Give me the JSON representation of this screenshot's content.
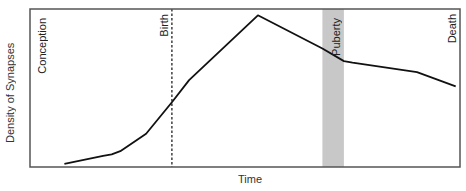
{
  "chart_data": {
    "type": "line",
    "title": "",
    "xlabel": "Time",
    "ylabel": "Density of Synapses",
    "grid": false,
    "legend": null,
    "xlim": [
      0,
      100
    ],
    "ylim": [
      0,
      100
    ],
    "annotations": [
      {
        "label": "Conception",
        "x": 2,
        "style": "text"
      },
      {
        "label": "Birth",
        "x": 33,
        "style": "dashed-vline"
      },
      {
        "label": "Puberty",
        "x_range": [
          68,
          73
        ],
        "style": "shaded-band",
        "color": "#c8c8c8"
      },
      {
        "label": "Death",
        "x": 99,
        "style": "text"
      }
    ],
    "series": [
      {
        "name": "Synaptic density",
        "color": "#111111",
        "x": [
          8,
          17,
          19,
          21,
          27,
          33,
          37,
          53,
          68,
          73,
          75,
          90,
          99
        ],
        "y": [
          2,
          7,
          8,
          10,
          21,
          41,
          55,
          96,
          75,
          67,
          66,
          60,
          51
        ]
      }
    ]
  },
  "labels": {
    "ylabel": "Density of Synapses",
    "xlabel": "Time",
    "conception": "Conception",
    "birth": "Birth",
    "puberty": "Puberty",
    "death": "Death"
  },
  "colors": {
    "frame": "#555555",
    "line": "#111111",
    "band": "#c8c8c8"
  }
}
